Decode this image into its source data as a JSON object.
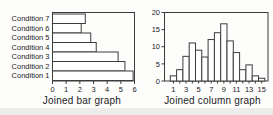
{
  "page": {
    "background": "#fdfdfc",
    "footer_band_color": "#ececea",
    "line_color": "#3c3c3c",
    "text_color": "#1c1c1c",
    "bar_fill": "#ffffff"
  },
  "chart_data": [
    {
      "type": "bar",
      "orientation": "horizontal",
      "title": "Joined bar graph",
      "categories": [
        "Condition 7",
        "Condition 6",
        "Condition 5",
        "Condition 4",
        "Condition 3",
        "Condition 2",
        "Condition 1"
      ],
      "values": [
        2.4,
        2.1,
        2.8,
        3.2,
        4.8,
        5.3,
        5.9
      ],
      "x_ticks": [
        "0",
        "1",
        "2",
        "3",
        "4",
        "5",
        "6"
      ],
      "xlim": [
        0,
        6
      ],
      "grid": false,
      "legend": "none",
      "bars_joined": true
    },
    {
      "type": "bar",
      "orientation": "vertical",
      "title": "Joined column graph",
      "x": [
        1,
        2,
        3,
        4,
        5,
        6,
        7,
        8,
        9,
        10,
        11,
        12,
        13,
        14,
        15
      ],
      "values": [
        1.5,
        3.3,
        7.2,
        11.1,
        9.0,
        7.0,
        12.1,
        14.1,
        16.7,
        11.7,
        8.3,
        3.3,
        4.7,
        1.5,
        0.8
      ],
      "y_ticks": [
        "0",
        "5",
        "10",
        "15",
        "20"
      ],
      "y_tick_values": [
        0,
        5,
        10,
        15,
        20
      ],
      "x_tick_labels": [
        "1",
        "3",
        "5",
        "7",
        "9",
        "11",
        "13",
        "15"
      ],
      "x_label_positions": [
        1,
        3,
        5,
        7,
        9,
        11,
        13,
        15
      ],
      "ylim": [
        0,
        20
      ],
      "grid": false,
      "legend": "none",
      "bars_joined": true
    }
  ]
}
